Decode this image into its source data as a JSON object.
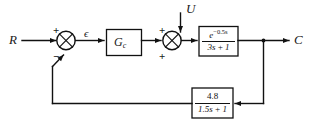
{
  "diagram": {
    "type": "control-system-block-diagram",
    "width": 312,
    "height": 127,
    "background_color": "#ffffff",
    "line_color": "#111111",
    "signals": {
      "reference_input": "R",
      "error_signal": "ϵ",
      "disturbance_input": "U",
      "controlled_output": "C"
    },
    "summing_junction_1": {
      "name": "error-summing-junction",
      "sign_top": "+",
      "sign_bottom": "−"
    },
    "summing_junction_2": {
      "name": "disturbance-summing-junction",
      "sign_top": "+",
      "sign_bottom": "+"
    },
    "controller_block": {
      "label_main": "G",
      "label_sub": "c"
    },
    "process_block": {
      "numerator_base": "e",
      "numerator_exponent": "−0.5s",
      "denominator": "3s + 1"
    },
    "feedback_block": {
      "numerator": "4.8",
      "denominator": "1.5s + 1"
    }
  }
}
